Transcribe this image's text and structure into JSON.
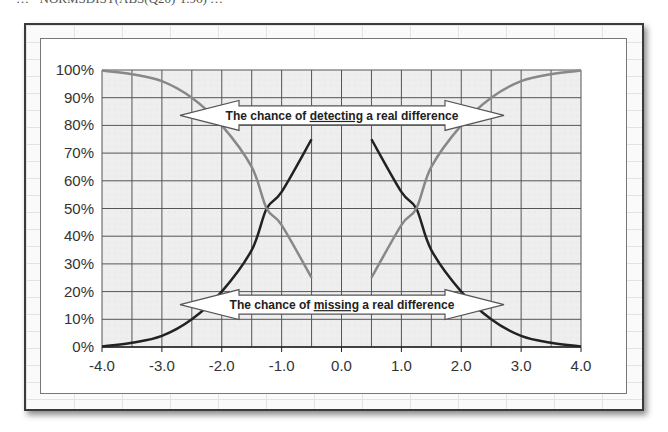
{
  "caption": "… =NORMSDIST(ABS(Q20)-1.96) …",
  "chart_data": {
    "type": "line",
    "title": "",
    "xlabel": "",
    "ylabel": "",
    "xlim": [
      -4.0,
      4.0
    ],
    "ylim": [
      0,
      100
    ],
    "grid": true,
    "x_ticks": [
      "-4.0",
      "-3.0",
      "-2.0",
      "-1.0",
      "0.0",
      "1.0",
      "2.0",
      "3.0",
      "4.0"
    ],
    "y_ticks": [
      "0%",
      "10%",
      "20%",
      "30%",
      "40%",
      "50%",
      "60%",
      "70%",
      "80%",
      "90%",
      "100%"
    ],
    "x": [
      -4.0,
      -3.5,
      -3.0,
      -2.5,
      -2.0,
      -1.5,
      -1.25,
      -1.0,
      -0.5,
      0.5,
      1.0,
      1.25,
      1.5,
      2.0,
      2.5,
      3.0,
      3.5,
      4.0
    ],
    "series": [
      {
        "name": "Chance of detecting a real difference",
        "color": "#222222",
        "values": [
          0.2,
          1.5,
          4,
          10,
          20,
          35,
          50,
          56,
          75,
          75,
          56,
          50,
          35,
          20,
          10,
          4,
          1.5,
          0.2
        ]
      },
      {
        "name": "Chance of missing a real difference",
        "color": "#888888",
        "values": [
          99.8,
          98.5,
          96,
          90,
          80,
          65,
          50,
          44,
          25,
          25,
          44,
          50,
          65,
          80,
          90,
          96,
          98.5,
          99.8
        ]
      }
    ],
    "annotations": [
      {
        "text_pre": "The chance of ",
        "text_emph": "detecting",
        "text_post": " a real difference",
        "y": 80
      },
      {
        "text_pre": "The chance of ",
        "text_emph": "missing",
        "text_post": " a real difference",
        "y": 20
      }
    ],
    "legend": "none"
  }
}
